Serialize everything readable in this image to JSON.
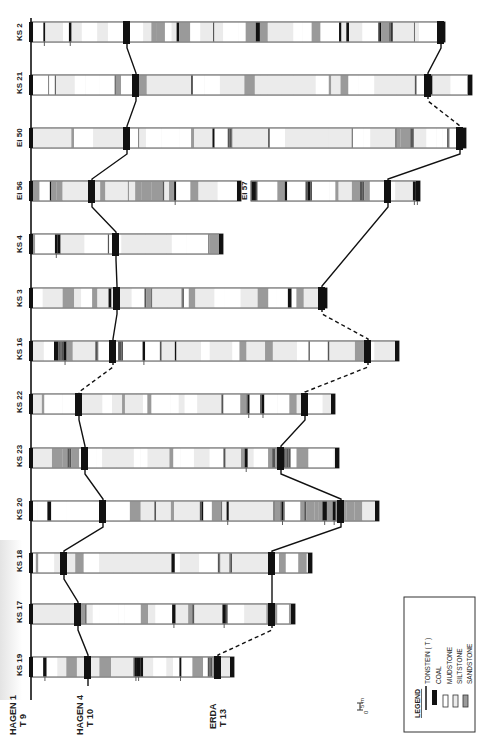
{
  "colors": {
    "coal": "#111111",
    "mudstone": "#ffffff",
    "siltstone": "#ebebeb",
    "sandstone": "#9a9a9a",
    "line": "#111111",
    "frame": "#666666"
  },
  "datum": {
    "label_line1": "HAGEN 1",
    "label_line2": "T 9"
  },
  "marker_labels": [
    {
      "id": "hagen4",
      "line1": "HAGEN 4",
      "line2": "T 10"
    },
    {
      "id": "erda",
      "line1": "ERDA",
      "line2": "T 13"
    }
  ],
  "wells": [
    {
      "name": "KS 2",
      "y": 22,
      "length": 414
    },
    {
      "name": "KS 21",
      "y": 75,
      "length": 441
    },
    {
      "name": "Ei 50",
      "y": 128,
      "length": 435
    },
    {
      "name": "Ei 56",
      "y": 181,
      "length": 210,
      "second_name": "Ei 57",
      "second_start": 251,
      "second_length": 169
    },
    {
      "name": "KS 4",
      "y": 234,
      "length": 192
    },
    {
      "name": "KS 3",
      "y": 288,
      "length": 296
    },
    {
      "name": "KS 16",
      "y": 341,
      "length": 368
    },
    {
      "name": "KS 22",
      "y": 394,
      "length": 304
    },
    {
      "name": "KS 23",
      "y": 448,
      "length": 308
    },
    {
      "name": "KS 20",
      "y": 501,
      "length": 348
    },
    {
      "name": "KS 18",
      "y": 553,
      "length": 281
    },
    {
      "name": "KS 17",
      "y": 604,
      "length": 264
    },
    {
      "name": "KS 19",
      "y": 657,
      "length": 203
    }
  ],
  "legend": {
    "title": "LEGEND",
    "items": [
      {
        "key": "tonstein",
        "label": "TONSTEIN ( T )"
      },
      {
        "key": "coal",
        "label": "COAL"
      },
      {
        "key": "mudstone",
        "label": "MUDSTONE"
      },
      {
        "key": "siltstone",
        "label": "SILTSTONE"
      },
      {
        "key": "sandstone",
        "label": "SANDSTONE"
      }
    ]
  },
  "scale": {
    "top": "5 m",
    "bottom": "0"
  }
}
